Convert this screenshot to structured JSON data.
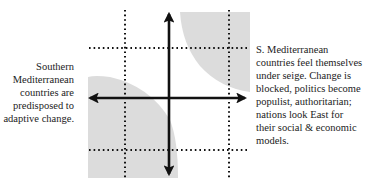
{
  "diagram": {
    "type": "quadrant-scenario-diagram",
    "left_caption": {
      "lines": [
        "Southern",
        "Mediterranean",
        "countries are",
        "predisposed to",
        "adaptive change."
      ]
    },
    "right_caption": {
      "lines": [
        "S. Mediterranean",
        "countries feel themselves",
        "under seige. Change is",
        "blocked, politics become",
        "populist, authoritarian;",
        "nations look East for",
        "their social & economic",
        "models."
      ]
    },
    "colors": {
      "shade": "#d9d9d9",
      "axis": "#111111",
      "dotted": "#111111",
      "text": "#222222"
    },
    "axes": {
      "vertical_arrow": {
        "direction": "both",
        "x": 169,
        "y1": 12,
        "y2": 176
      },
      "horizontal_arrow": {
        "direction": "both",
        "y": 98,
        "x1": 88,
        "x2": 247
      }
    },
    "dotted_lines": {
      "vertical_x": [
        125,
        229
      ],
      "horizontal_y": [
        48,
        150
      ]
    },
    "shaded_regions": [
      {
        "name": "bottom-left",
        "label_ref": "left_caption"
      },
      {
        "name": "top-right",
        "label_ref": "right_caption"
      }
    ]
  }
}
